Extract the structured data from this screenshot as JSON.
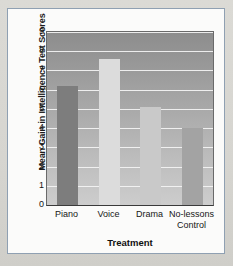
{
  "chart_data": {
    "type": "bar",
    "title": "",
    "xlabel": "Treatment",
    "ylabel": "Mean Gain in Intelligence Test Scores",
    "categories": [
      "Piano",
      "Voice",
      "Drama",
      "No-lessons Control"
    ],
    "values": [
      6.2,
      7.6,
      5.1,
      4.0
    ],
    "ylim": [
      0,
      9
    ],
    "yticks": [
      0,
      1,
      2,
      3,
      4,
      5,
      6,
      7,
      8,
      9
    ],
    "ytick_labels": [
      "0",
      "1",
      "2",
      "3",
      "4",
      "5",
      "6",
      "7",
      "8",
      "9"
    ],
    "grid": true,
    "grid_axis": "y",
    "grid_color": "#f4f4f4",
    "legend": false,
    "bar_colors": [
      "#7d7d7d",
      "#dcdcdc",
      "#c9c9c9",
      "#a3a3a3"
    ],
    "plot_background": "#a5a5a5",
    "series": [
      {
        "name": "Mean Gain in Intelligence Test Scores",
        "values": [
          6.2,
          7.6,
          5.1,
          4.0
        ]
      }
    ]
  },
  "axis": {
    "x_title": "Treatment",
    "y_title": "Mean Gain in Intelligence Test Scores",
    "y_ticks": [
      "0",
      "1",
      "2",
      "3",
      "4",
      "5",
      "6",
      "7",
      "8",
      "9"
    ],
    "x_tick_labels": [
      {
        "line1": "Piano",
        "line2": ""
      },
      {
        "line1": "Voice",
        "line2": ""
      },
      {
        "line1": "Drama",
        "line2": ""
      },
      {
        "line1": "No-lessons",
        "line2": "Control"
      }
    ]
  },
  "theme": {
    "page_background": "#d9d8d3",
    "card_background": "#fbfbfa",
    "card_border": "#8fa0b2",
    "axis_text": "#141414"
  }
}
